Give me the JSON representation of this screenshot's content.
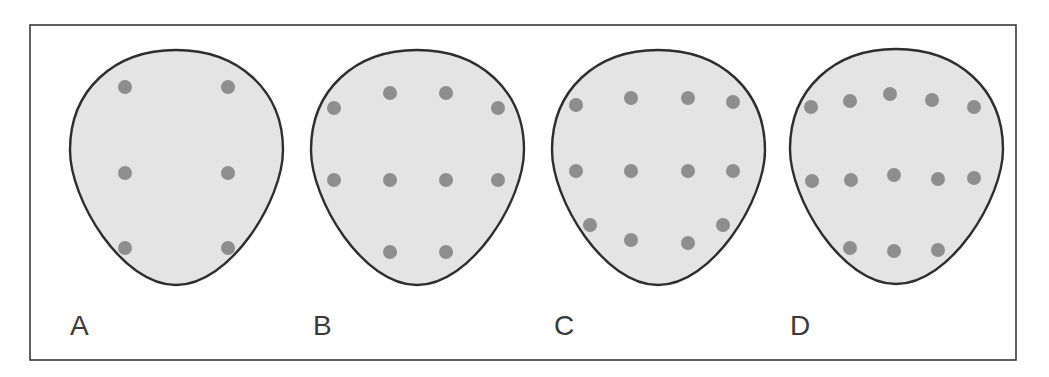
{
  "figure": {
    "frame": {
      "x": 30,
      "y": 25,
      "width": 986,
      "height": 335,
      "stroke": "#3a3a3a"
    },
    "style": {
      "shape_fill": "#e4e4e4",
      "shape_stroke": "#2e2e2e",
      "dot_fill": "#8e8e8e",
      "dot_radius": 7
    },
    "panels": [
      {
        "label": "A",
        "offset": [
          70,
          50
        ],
        "label_pos": [
          70,
          312
        ],
        "dot_count": 6,
        "dots": [
          [
            125,
            87
          ],
          [
            228,
            87
          ],
          [
            125,
            173
          ],
          [
            228,
            173
          ],
          [
            125,
            248
          ],
          [
            228,
            248
          ]
        ]
      },
      {
        "label": "B",
        "offset": [
          311,
          50
        ],
        "label_pos": [
          313,
          312
        ],
        "dot_count": 10,
        "dots": [
          [
            334,
            108
          ],
          [
            390,
            93
          ],
          [
            446,
            93
          ],
          [
            498,
            108
          ],
          [
            334,
            180
          ],
          [
            390,
            180
          ],
          [
            446,
            180
          ],
          [
            498,
            180
          ],
          [
            390,
            252
          ],
          [
            446,
            252
          ]
        ]
      },
      {
        "label": "C",
        "offset": [
          552,
          50
        ],
        "label_pos": [
          554,
          312
        ],
        "dot_count": 12,
        "dots": [
          [
            576,
            105
          ],
          [
            631,
            98
          ],
          [
            688,
            98
          ],
          [
            733,
            102
          ],
          [
            576,
            171
          ],
          [
            631,
            171
          ],
          [
            688,
            171
          ],
          [
            733,
            171
          ],
          [
            590,
            225
          ],
          [
            631,
            240
          ],
          [
            688,
            243
          ],
          [
            723,
            225
          ]
        ]
      },
      {
        "label": "D",
        "offset": [
          790,
          49
        ],
        "label_pos": [
          790,
          312
        ],
        "dot_count": 13,
        "dots": [
          [
            811,
            107
          ],
          [
            850,
            101
          ],
          [
            890,
            94
          ],
          [
            932,
            100
          ],
          [
            974,
            107
          ],
          [
            812,
            181
          ],
          [
            851,
            180
          ],
          [
            894,
            175
          ],
          [
            938,
            179
          ],
          [
            974,
            178
          ],
          [
            850,
            248
          ],
          [
            894,
            251
          ],
          [
            938,
            250
          ]
        ]
      }
    ]
  }
}
